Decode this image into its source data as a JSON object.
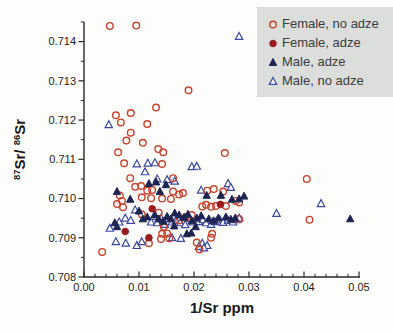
{
  "figure": {
    "kind": "scatter plot, scanned print figure"
  },
  "colors": {
    "axis": "#2a2627",
    "tick_text": "#242122",
    "legend_bg": "#dbdedb",
    "legend_text": "#3d3b3c",
    "female_no_adze": "#c6432d",
    "female_adze": "#9b1c1c",
    "male_adze": "#1e2452",
    "male_no_adze": "#3b4a9e"
  },
  "chart_data": {
    "type": "scatter",
    "title": "",
    "xlabel": "1/Sr ppm",
    "ylabel": "87Sr/86Sr",
    "ylabel_parts": [
      {
        "text": "87",
        "sup": true
      },
      {
        "text": "Sr/ ",
        "sup": false
      },
      {
        "text": "86",
        "sup": true
      },
      {
        "text": "Sr",
        "sup": false
      }
    ],
    "xlim": [
      0,
      0.05
    ],
    "ylim": [
      0.708,
      0.7145
    ],
    "x_ticks": [
      0.0,
      0.01,
      0.02,
      0.03,
      0.04,
      0.05
    ],
    "x_tick_labels": [
      "0.00",
      "0.01",
      "0.02",
      "0.03",
      "0.04",
      "0.05"
    ],
    "x_minor_step": 0.002,
    "y_ticks": [
      0.708,
      0.709,
      0.71,
      0.711,
      0.712,
      0.713,
      0.714
    ],
    "y_tick_labels": [
      "0.708",
      "0.709",
      "0.710",
      "0.711",
      "0.712",
      "0.713",
      "0.714"
    ],
    "y_minor_step": 0.0005,
    "grid": false,
    "legend_position": "top-right",
    "series": [
      {
        "name": "Female, no adze",
        "marker": "circle",
        "fill": "none",
        "color": "#c6432d",
        "points": [
          [
            0.0047,
            0.7144
          ],
          [
            0.0095,
            0.71441
          ],
          [
            0.019,
            0.71276
          ],
          [
            0.0131,
            0.71232
          ],
          [
            0.0058,
            0.71212
          ],
          [
            0.0085,
            0.71218
          ],
          [
            0.0067,
            0.71194
          ],
          [
            0.0115,
            0.7119
          ],
          [
            0.0085,
            0.71168
          ],
          [
            0.0077,
            0.71148
          ],
          [
            0.0107,
            0.71142
          ],
          [
            0.0135,
            0.71126
          ],
          [
            0.0144,
            0.71118
          ],
          [
            0.0062,
            0.71118
          ],
          [
            0.0256,
            0.71116
          ],
          [
            0.0073,
            0.7109
          ],
          [
            0.0142,
            0.71088
          ],
          [
            0.0084,
            0.71052
          ],
          [
            0.0162,
            0.71052
          ],
          [
            0.0405,
            0.7105
          ],
          [
            0.0093,
            0.7103
          ],
          [
            0.0104,
            0.71032
          ],
          [
            0.0115,
            0.7102
          ],
          [
            0.0124,
            0.71022
          ],
          [
            0.0162,
            0.71018
          ],
          [
            0.018,
            0.71014
          ],
          [
            0.0224,
            0.7102
          ],
          [
            0.0253,
            0.71018
          ],
          [
            0.0236,
            0.71024
          ],
          [
            0.0065,
            0.71008
          ],
          [
            0.0173,
            0.7101
          ],
          [
            0.0105,
            0.71003
          ],
          [
            0.0122,
            0.71001
          ],
          [
            0.0142,
            0.71
          ],
          [
            0.0158,
            0.70999
          ],
          [
            0.0069,
            0.70994
          ],
          [
            0.0276,
            0.70994
          ],
          [
            0.0282,
            0.7099
          ],
          [
            0.006,
            0.70986
          ],
          [
            0.0071,
            0.70978
          ],
          [
            0.0215,
            0.7098
          ],
          [
            0.0222,
            0.70984
          ],
          [
            0.0231,
            0.70979
          ],
          [
            0.024,
            0.70981
          ],
          [
            0.0258,
            0.70981
          ],
          [
            0.0105,
            0.7096
          ],
          [
            0.0136,
            0.70964
          ],
          [
            0.0173,
            0.70944
          ],
          [
            0.0196,
            0.70958
          ],
          [
            0.0185,
            0.70952
          ],
          [
            0.041,
            0.70946
          ],
          [
            0.0282,
            0.70948
          ],
          [
            0.0145,
            0.70928
          ],
          [
            0.0142,
            0.7091
          ],
          [
            0.0151,
            0.70911
          ],
          [
            0.0233,
            0.7091
          ],
          [
            0.014,
            0.70897
          ],
          [
            0.0155,
            0.70899
          ],
          [
            0.0231,
            0.709
          ],
          [
            0.0118,
            0.70886
          ],
          [
            0.0205,
            0.70888
          ],
          [
            0.0033,
            0.70864
          ],
          [
            0.021,
            0.7087
          ]
        ]
      },
      {
        "name": "Female, adze",
        "marker": "circle",
        "fill": "#9b1c1c",
        "color": "#9b1c1c",
        "points": [
          [
            0.0075,
            0.70916
          ],
          [
            0.0118,
            0.709
          ],
          [
            0.0124,
            0.70974
          ],
          [
            0.0248,
            0.70985
          ]
        ]
      },
      {
        "name": "Male, adze",
        "marker": "triangle",
        "fill": "#1e2452",
        "color": "#1e2452",
        "points": [
          [
            0.0056,
            0.70938
          ],
          [
            0.006,
            0.70928
          ],
          [
            0.006,
            0.71018
          ],
          [
            0.0084,
            0.70998
          ],
          [
            0.0118,
            0.71038
          ],
          [
            0.0131,
            0.71042
          ],
          [
            0.0149,
            0.71035
          ],
          [
            0.0138,
            0.71018
          ],
          [
            0.0223,
            0.71008
          ],
          [
            0.0249,
            0.71008
          ],
          [
            0.0269,
            0.70998
          ],
          [
            0.0282,
            0.70999
          ],
          [
            0.0291,
            0.71006
          ],
          [
            0.01,
            0.70968
          ],
          [
            0.0107,
            0.70948
          ],
          [
            0.0115,
            0.70953
          ],
          [
            0.0129,
            0.70958
          ],
          [
            0.0136,
            0.70948
          ],
          [
            0.0144,
            0.70942
          ],
          [
            0.0151,
            0.70954
          ],
          [
            0.0158,
            0.70948
          ],
          [
            0.0165,
            0.70963
          ],
          [
            0.0173,
            0.70958
          ],
          [
            0.0182,
            0.70952
          ],
          [
            0.0189,
            0.7096
          ],
          [
            0.0196,
            0.70943
          ],
          [
            0.0205,
            0.7095
          ],
          [
            0.0213,
            0.70956
          ],
          [
            0.0227,
            0.70948
          ],
          [
            0.0235,
            0.70943
          ],
          [
            0.0244,
            0.7095
          ],
          [
            0.0258,
            0.70953
          ],
          [
            0.0267,
            0.70947
          ],
          [
            0.0275,
            0.7095
          ],
          [
            0.0187,
            0.7091
          ],
          [
            0.0195,
            0.70912
          ],
          [
            0.0164,
            0.7093
          ],
          [
            0.0203,
            0.70928
          ],
          [
            0.0484,
            0.70948
          ]
        ]
      },
      {
        "name": "Male, no adze",
        "marker": "triangle",
        "fill": "none",
        "color": "#3b4a9e",
        "points": [
          [
            0.0282,
            0.71413
          ],
          [
            0.0045,
            0.71188
          ],
          [
            0.0096,
            0.71088
          ],
          [
            0.0116,
            0.7109
          ],
          [
            0.0129,
            0.71091
          ],
          [
            0.0196,
            0.71081
          ],
          [
            0.0205,
            0.71082
          ],
          [
            0.0111,
            0.71068
          ],
          [
            0.0133,
            0.7105
          ],
          [
            0.0151,
            0.71048
          ],
          [
            0.0165,
            0.71044
          ],
          [
            0.0213,
            0.71021
          ],
          [
            0.0262,
            0.71038
          ],
          [
            0.0267,
            0.71028
          ],
          [
            0.0093,
            0.70971
          ],
          [
            0.0075,
            0.7095
          ],
          [
            0.0085,
            0.70944
          ],
          [
            0.0122,
            0.7094
          ],
          [
            0.0127,
            0.70954
          ],
          [
            0.0133,
            0.70938
          ],
          [
            0.014,
            0.7095
          ],
          [
            0.0147,
            0.70934
          ],
          [
            0.0153,
            0.70949
          ],
          [
            0.016,
            0.7094
          ],
          [
            0.0167,
            0.70944
          ],
          [
            0.0175,
            0.70938
          ],
          [
            0.0184,
            0.70933
          ],
          [
            0.0191,
            0.70949
          ],
          [
            0.0198,
            0.7094
          ],
          [
            0.0209,
            0.70941
          ],
          [
            0.0216,
            0.70946
          ],
          [
            0.0222,
            0.70938
          ],
          [
            0.0231,
            0.70934
          ],
          [
            0.0238,
            0.70941
          ],
          [
            0.0247,
            0.70946
          ],
          [
            0.0253,
            0.70939
          ],
          [
            0.0262,
            0.70944
          ],
          [
            0.0271,
            0.7094
          ],
          [
            0.0278,
            0.70946
          ],
          [
            0.0282,
            0.7095
          ],
          [
            0.035,
            0.70962
          ],
          [
            0.0431,
            0.70987
          ],
          [
            0.0064,
            0.7094
          ],
          [
            0.0047,
            0.70924
          ],
          [
            0.016,
            0.709
          ],
          [
            0.0176,
            0.70898
          ],
          [
            0.0058,
            0.7089
          ],
          [
            0.0076,
            0.70886
          ],
          [
            0.0096,
            0.7088
          ],
          [
            0.0105,
            0.7089
          ],
          [
            0.0215,
            0.70886
          ],
          [
            0.0224,
            0.7088
          ],
          [
            0.0209,
            0.70878
          ],
          [
            0.0218,
            0.70874
          ]
        ]
      }
    ]
  }
}
